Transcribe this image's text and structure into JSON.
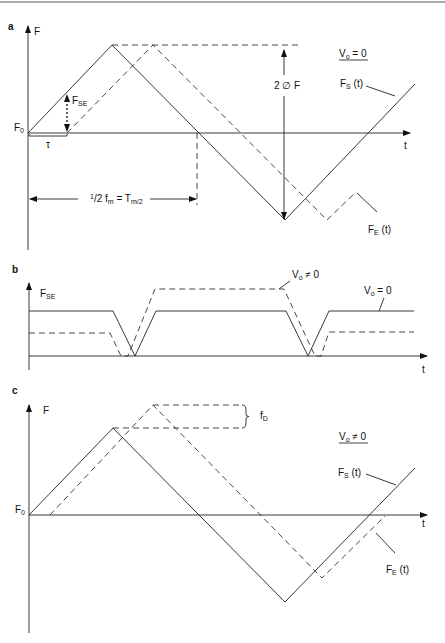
{
  "figure": {
    "panels": [
      {
        "id": "a",
        "label": "a",
        "y_axis_label": "F",
        "x_axis_label": "t",
        "origin_label": "F",
        "origin_sub": "0",
        "condition": "V",
        "condition_sub": "o",
        "condition_rel": " = 0",
        "amplitude_label": "2 ∅ F",
        "delay_label": "τ",
        "fse_label": "F",
        "fse_sub": "SE",
        "period_label_pre": "1",
        "period_label_mid": "/2 f",
        "period_label_sub": "m",
        "period_label_eq": " = T",
        "period_label_sub2": "m/2",
        "fs_label": "F",
        "fs_sub": "S",
        "fs_suffix": " (t)",
        "fe_label": "F",
        "fe_sub": "E",
        "fe_suffix": " (t)"
      },
      {
        "id": "b",
        "label": "b",
        "y_axis_label": "F",
        "y_axis_sub": "SE",
        "x_axis_label": "t",
        "dashed_condition": "V",
        "dashed_condition_sub": "o",
        "dashed_condition_rel": " ≠ 0",
        "solid_condition": "V",
        "solid_condition_sub": "o",
        "solid_condition_rel": " = 0"
      },
      {
        "id": "c",
        "label": "c",
        "y_axis_label": "F",
        "x_axis_label": "t",
        "origin_label": "F",
        "origin_sub": "0",
        "condition": "V",
        "condition_sub": "o",
        "condition_rel": " ≠ 0",
        "doppler_label": "f",
        "doppler_sub": "D",
        "fs_label": "F",
        "fs_sub": "S",
        "fs_suffix": " (t)",
        "fe_label": "F",
        "fe_sub": "E",
        "fe_suffix": " (t)"
      }
    ]
  }
}
